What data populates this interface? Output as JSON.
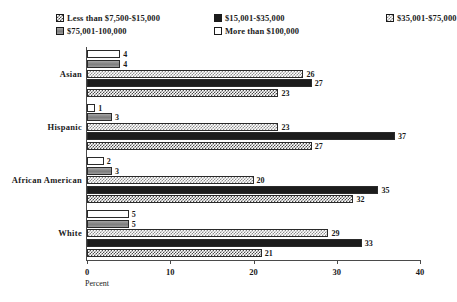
{
  "chart_data": {
    "type": "bar",
    "orientation": "horizontal",
    "title": "",
    "xlabel": "Percent",
    "ylabel": "",
    "xlim": [
      0,
      40
    ],
    "xticks": [
      0,
      10,
      20,
      30,
      40
    ],
    "grid": false,
    "legend_position": "top",
    "categories": [
      "Asian",
      "Hispanic",
      "African American",
      "White"
    ],
    "series": [
      {
        "name": "Less than $7,500-$15,000",
        "pattern": "crosshatch",
        "values": [
          23,
          27,
          32,
          21
        ]
      },
      {
        "name": "$15,001-$35,000",
        "pattern": "solid-black",
        "values": [
          27,
          37,
          35,
          33
        ]
      },
      {
        "name": "$35,001-$75,000",
        "pattern": "checker",
        "values": [
          26,
          23,
          20,
          29
        ]
      },
      {
        "name": "$75,001-100,000",
        "pattern": "solid-gray",
        "values": [
          4,
          3,
          3,
          5
        ]
      },
      {
        "name": "More than $100,000",
        "pattern": "white",
        "values": [
          4,
          1,
          2,
          5
        ]
      }
    ]
  },
  "legend": {
    "items": [
      {
        "label": "Less than $7,500-$15,000"
      },
      {
        "label": "$15,001-$35,000"
      },
      {
        "label": "$35,001-$75,000"
      },
      {
        "label": "$75,001-100,000"
      },
      {
        "label": "More than $100,000"
      }
    ]
  },
  "axis": {
    "x_title": "Percent",
    "x_tick_labels": [
      "0",
      "10",
      "20",
      "30",
      "40"
    ]
  }
}
